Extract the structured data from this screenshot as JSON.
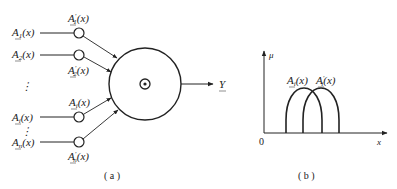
{
  "figure_a": {
    "caption": "( a )",
    "inputs": [
      {
        "name": "A",
        "sub": "1",
        "arg": "(x)"
      },
      {
        "name": "A",
        "sub": "2",
        "arg": "(x)"
      },
      {
        "name": "A",
        "sub": "i",
        "arg": "(x)"
      },
      {
        "name": "A",
        "sub": "n",
        "arg": "(x)"
      }
    ],
    "weights": [
      {
        "name": "A",
        "prime": "′",
        "sub": "1",
        "arg": "(x)"
      },
      {
        "name": "A",
        "prime": "′",
        "sub": "2",
        "arg": "(x)"
      },
      {
        "name": "A",
        "prime": "",
        "sub": "i",
        "arg": "(x)"
      },
      {
        "name": "A",
        "prime": "′",
        "sub": "n",
        "arg": "(x)"
      }
    ],
    "ellipsis": "⋮",
    "output": "Y",
    "operator_icon": "circled-dot"
  },
  "figure_b": {
    "caption": "( b )",
    "y_axis": "μ",
    "x_axis": "x",
    "origin": "0",
    "curve1": {
      "name": "A",
      "prime": "",
      "sub": "i",
      "arg": "(x)"
    },
    "curve2": {
      "name": "A",
      "prime": "′",
      "sub": "i",
      "arg": "(x)"
    }
  }
}
